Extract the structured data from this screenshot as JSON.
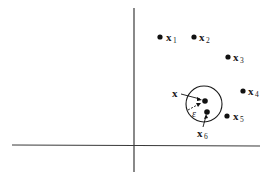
{
  "diagram": {
    "type": "nearest-neighbor-epsilon-ball",
    "axes": {
      "color": "#3a3a3a"
    },
    "points": [
      {
        "id": "x1",
        "label": "x",
        "sub": "1",
        "cx": 160,
        "cy": 37
      },
      {
        "id": "x2",
        "label": "x",
        "sub": "2",
        "cx": 194,
        "cy": 37
      },
      {
        "id": "x3",
        "label": "x",
        "sub": "3",
        "cx": 228,
        "cy": 57
      },
      {
        "id": "x4",
        "label": "x",
        "sub": "4",
        "cx": 243,
        "cy": 91
      },
      {
        "id": "x5",
        "label": "x",
        "sub": "5",
        "cx": 227,
        "cy": 116
      },
      {
        "id": "x6",
        "label": "x",
        "sub": "6",
        "cx": 207,
        "cy": 112
      }
    ],
    "query": {
      "label": "x",
      "cx": 204,
      "cy": 101
    },
    "ball": {
      "cx": 204,
      "cy": 104,
      "r": 18
    },
    "epsilon_label": "ε"
  }
}
